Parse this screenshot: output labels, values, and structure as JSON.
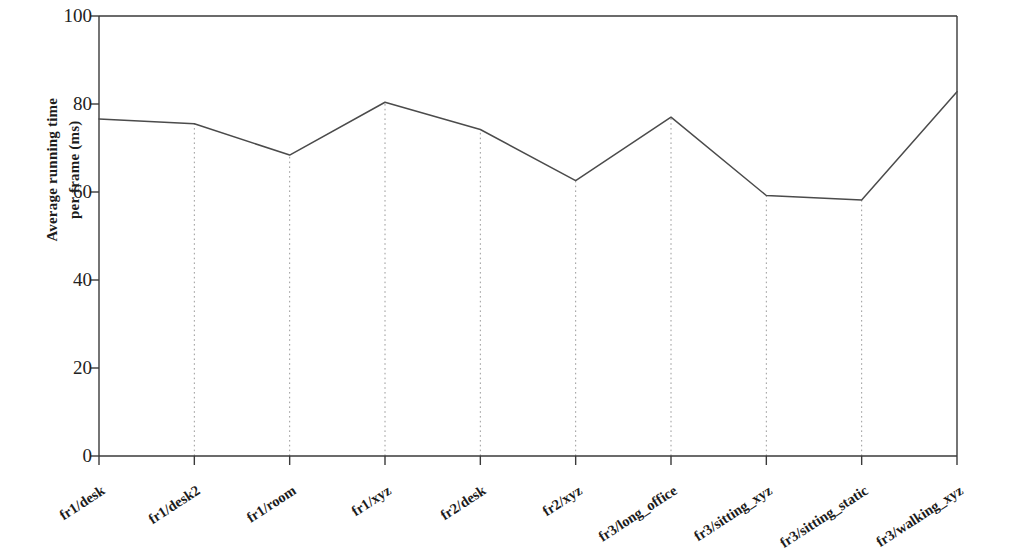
{
  "chart_data": {
    "type": "line",
    "title": "",
    "subtitle": "",
    "xlabel": "",
    "ylabel": "Average running time per frame (ms)",
    "ylabel_lines": [
      "Average running time",
      "per frame (ms)"
    ],
    "categories": [
      "fr1/desk",
      "fr1/desk2",
      "fr1/room",
      "fr1/xyz",
      "fr2/desk",
      "fr2/xyz",
      "fr3/long_office",
      "fr3/sitting_xyz",
      "fr3/sitting_static",
      "fr3/walking_xyz"
    ],
    "values": [
      76.6,
      75.5,
      68.4,
      80.4,
      74.2,
      62.6,
      77.0,
      59.2,
      58.2,
      82.8
    ],
    "series": [
      {
        "name": "Average running time per frame (ms)",
        "values": [
          76.6,
          75.5,
          68.4,
          80.4,
          74.2,
          62.6,
          77.0,
          59.2,
          58.2,
          82.8
        ]
      }
    ],
    "ylim": [
      0,
      100
    ],
    "ytick_labels": [
      "0",
      "20",
      "40",
      "60",
      "80",
      "100"
    ],
    "ytick_values": [
      0,
      20,
      40,
      60,
      80,
      100
    ],
    "grid": "vertical-dotted-at-categories",
    "legend": "none",
    "line_color": "#4b4b4b",
    "grid_color": "#9a9a9a",
    "axis_color": "#3a3a3a",
    "background_color": "#ffffff"
  },
  "axis": {
    "y_label_line1": "Average running time",
    "y_label_line2": "per frame (ms)"
  }
}
